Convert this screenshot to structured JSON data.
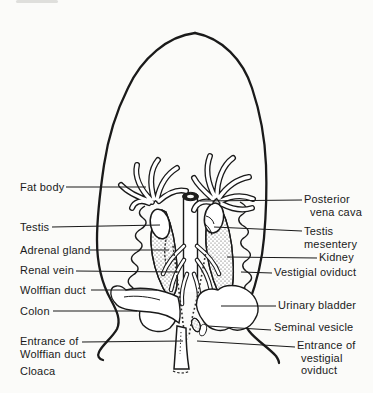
{
  "figure": {
    "paper_color": "#fbfbf9",
    "ink_color": "#1a1a1a",
    "labels": {
      "fat_body": "Fat body",
      "testis": "Testis",
      "adrenal_gland": "Adrenal gland",
      "renal_vein": "Renal vein",
      "wolffian_duct": "Wolffian duct",
      "colon": "Colon",
      "entrance_wolffian_line1": "Entrance of",
      "entrance_wolffian_line2": "Wolffian duct",
      "cloaca": "Cloaca",
      "posterior_vena_cava_line1": "Posterior",
      "posterior_vena_cava_line2": "vena cava",
      "testis_mesentery_line1": "Testis",
      "testis_mesentery_line2": "mesentery",
      "kidney": "Kidney",
      "vestigial_oviduct": "Vestigial oviduct",
      "urinary_bladder": "Urinary bladder",
      "seminal_vesicle": "Seminal vesicle",
      "entrance_vestigial_line1": "Entrance of",
      "entrance_vestigial_line2": "vestigial",
      "entrance_vestigial_line3": "oviduct"
    }
  }
}
